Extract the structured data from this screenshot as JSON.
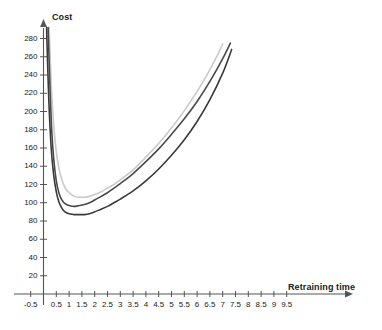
{
  "chart_data": {
    "type": "line",
    "title": "",
    "xlabel": "Retraining time",
    "ylabel": "Cost",
    "xlim": [
      -0.9,
      10.0
    ],
    "ylim": [
      0,
      295
    ],
    "grid": false,
    "legend": "none",
    "x_ticks": [
      "-0.5",
      "0.5",
      "1",
      "1.5",
      "2",
      "2.5",
      "3",
      "3.5",
      "4",
      "4.5",
      "5",
      "5.5",
      "6",
      "6.5",
      "7",
      "7.5",
      "8",
      "8.5",
      "9",
      "9.5"
    ],
    "x_tick_values": [
      -0.5,
      0.5,
      1,
      1.5,
      2,
      2.5,
      3,
      3.5,
      4,
      4.5,
      5,
      5.5,
      6,
      6.5,
      7,
      7.5,
      8,
      8.5,
      9,
      9.5
    ],
    "y_ticks": [
      "20",
      "40",
      "60",
      "80",
      "100",
      "120",
      "140",
      "160",
      "180",
      "200",
      "220",
      "240",
      "260",
      "280"
    ],
    "y_tick_values": [
      20,
      40,
      60,
      80,
      100,
      120,
      140,
      160,
      180,
      200,
      220,
      240,
      260,
      280
    ],
    "axis_arrows": [
      "x-right",
      "y-up"
    ],
    "series": [
      {
        "name": "curve-light",
        "color": "#c9c9c9",
        "width": 1.6,
        "x": [
          0.22,
          0.3,
          0.4,
          0.5,
          0.6,
          0.7,
          0.8,
          0.9,
          1.0,
          1.2,
          1.4,
          1.6,
          1.8,
          2.0,
          2.25,
          2.5,
          2.75,
          3.0,
          3.5,
          4.0,
          4.5,
          5.0,
          5.5,
          6.0,
          6.5,
          6.8,
          7.0
        ],
        "y": [
          292,
          232,
          184,
          156,
          138,
          127,
          119,
          114,
          111,
          107,
          106,
          106,
          107,
          109,
          112,
          116,
          120,
          125,
          136,
          150,
          165,
          182,
          201,
          222,
          246,
          262,
          274
        ]
      },
      {
        "name": "curve-mid",
        "color": "#4a4a4a",
        "width": 1.6,
        "x": [
          0.18,
          0.25,
          0.32,
          0.4,
          0.5,
          0.6,
          0.7,
          0.8,
          0.9,
          1.0,
          1.2,
          1.4,
          1.6,
          1.8,
          2.0,
          2.25,
          2.5,
          2.75,
          3.0,
          3.5,
          4.0,
          4.5,
          5.0,
          5.5,
          6.0,
          6.5,
          7.0,
          7.3
        ],
        "y": [
          292,
          230,
          180,
          148,
          124,
          111,
          104,
          100,
          98,
          97,
          96,
          97,
          98,
          100,
          103,
          107,
          111,
          116,
          121,
          132,
          145,
          159,
          175,
          192,
          211,
          233,
          258,
          275
        ]
      },
      {
        "name": "curve-dark",
        "color": "#3a3a3a",
        "width": 1.6,
        "x": [
          0.12,
          0.2,
          0.3,
          0.4,
          0.5,
          0.6,
          0.7,
          0.8,
          0.9,
          1.0,
          1.2,
          1.4,
          1.6,
          1.8,
          2.0,
          2.25,
          2.5,
          2.75,
          3.0,
          3.5,
          4.0,
          4.5,
          5.0,
          5.5,
          6.0,
          6.5,
          7.0,
          7.35
        ],
        "y": [
          292,
          218,
          160,
          130,
          112,
          101,
          95,
          91,
          89,
          88,
          87,
          87,
          87,
          88,
          90,
          93,
          96,
          100,
          104,
          113,
          124,
          137,
          152,
          169,
          189,
          213,
          242,
          268
        ]
      }
    ]
  }
}
